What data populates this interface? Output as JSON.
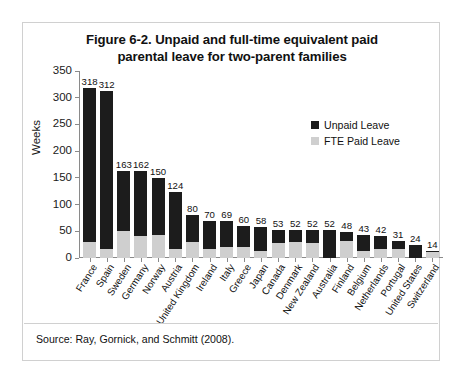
{
  "figure": {
    "title_line1": "Figure 6-2. Unpaid and full-time equivalent paid",
    "title_line2": "parental leave for two-parent families",
    "source": "Source: Ray, Gornick, and Schmitt (2008)."
  },
  "legend": {
    "position": "top-right",
    "items": [
      {
        "label": "Unpaid Leave",
        "color": "#1c1c1c"
      },
      {
        "label": "FTE Paid Leave",
        "color": "#cfcfcf"
      }
    ]
  },
  "chart_data": {
    "type": "bar",
    "subtype": "stacked-bar",
    "title": "Figure 6-2. Unpaid and full-time equivalent paid parental leave for two-parent families",
    "xlabel": "",
    "ylabel": "Weeks",
    "ylim": [
      0,
      350
    ],
    "yticks": [
      0,
      50,
      100,
      150,
      200,
      250,
      300,
      350
    ],
    "grid": false,
    "legend_position": "top-right",
    "categories": [
      "France",
      "Spain",
      "Sweden",
      "Germany",
      "Norway",
      "Austria",
      "United Kingdom",
      "Ireland",
      "Italy",
      "Greece",
      "Japan",
      "Canada",
      "Denmark",
      "New Zealand",
      "Australia",
      "Finland",
      "Belgium",
      "Netherlands",
      "Portugal",
      "United States",
      "Switzerland"
    ],
    "totals": [
      318,
      312,
      163,
      162,
      150,
      124,
      80,
      70,
      69,
      60,
      58,
      53,
      52,
      52,
      52,
      48,
      43,
      42,
      31,
      24,
      14
    ],
    "series": [
      {
        "name": "FTE Paid Leave",
        "color": "#cfcfcf",
        "values": [
          30,
          16,
          51,
          42,
          44,
          16,
          30,
          17,
          20,
          21,
          14,
          29,
          30,
          29,
          0,
          32,
          13,
          16,
          17,
          0,
          12
        ]
      },
      {
        "name": "Unpaid Leave",
        "color": "#1c1c1c",
        "values": [
          288,
          296,
          112,
          120,
          106,
          108,
          50,
          53,
          49,
          39,
          44,
          24,
          22,
          23,
          52,
          16,
          30,
          26,
          14,
          24,
          2
        ]
      }
    ],
    "data_labels": [
      "318",
      "312",
      "163",
      "162",
      "150",
      "124",
      "80",
      "70",
      "69",
      "60",
      "58",
      "53",
      "52",
      "52",
      "52",
      "48",
      "43",
      "42",
      "31",
      "24",
      "14"
    ]
  }
}
